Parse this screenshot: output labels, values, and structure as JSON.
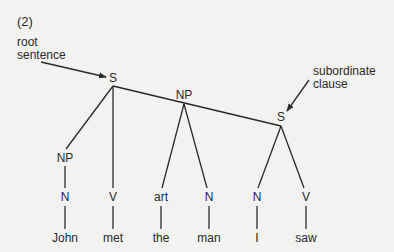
{
  "figure_number": "(2)",
  "annotations": {
    "root": {
      "line1": "root",
      "line2": "sentence"
    },
    "subordinate": {
      "line1": "subordinate",
      "line2": "clause"
    }
  },
  "nodes": {
    "root_s": "S",
    "np_object": "NP",
    "sub_s": "S",
    "np_subject": "NP",
    "n_john": "N",
    "v_met": "V",
    "art_the": "art",
    "n_man": "N",
    "n_i": "N",
    "v_saw": "V"
  },
  "words": [
    "John",
    "met",
    "the",
    "man",
    "I",
    "saw"
  ],
  "colors": {
    "background": "#f2f2f0",
    "ink": "#2a2a2a"
  }
}
